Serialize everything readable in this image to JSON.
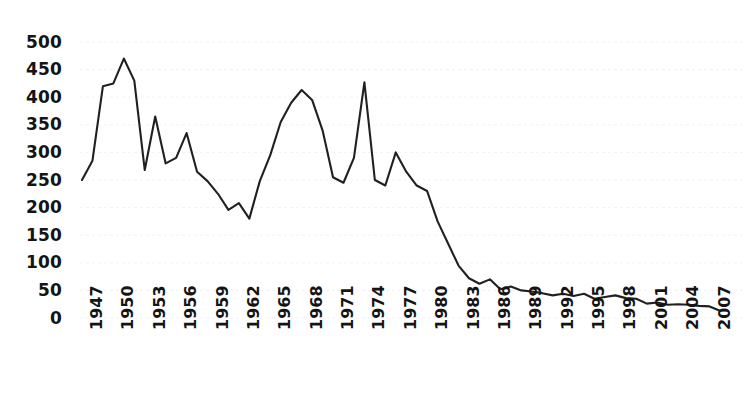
{
  "chart_data": {
    "type": "line",
    "title": "",
    "subtitle": "",
    "xlabel": "",
    "ylabel": "",
    "xlim": [
      1947,
      2008
    ],
    "ylim": [
      0,
      500
    ],
    "grid": true,
    "legend": null,
    "legend_position": "none",
    "line_color": "#231f20",
    "background_color": "#ffffff",
    "gridline_color": "#f2f2f2",
    "y_ticks": [
      0,
      50,
      100,
      150,
      200,
      250,
      300,
      350,
      400,
      450,
      500
    ],
    "y_tick_labels": [
      "0",
      "50",
      "100",
      "150",
      "200",
      "250",
      "300",
      "350",
      "400",
      "450",
      "500"
    ],
    "x_ticks": [
      1947,
      1950,
      1953,
      1956,
      1959,
      1962,
      1965,
      1968,
      1971,
      1974,
      1977,
      1980,
      1983,
      1986,
      1989,
      1992,
      1995,
      1998,
      2001,
      2004,
      2007
    ],
    "x_tick_labels": [
      "1947",
      "1950",
      "1953",
      "1956",
      "1959",
      "1962",
      "1965",
      "1968",
      "1971",
      "1974",
      "1977",
      "1980",
      "1983",
      "1986",
      "1989",
      "1992",
      "1995",
      "1998",
      "2001",
      "2004",
      "2007"
    ],
    "x": [
      1947,
      1948,
      1949,
      1950,
      1951,
      1952,
      1953,
      1954,
      1955,
      1956,
      1957,
      1958,
      1959,
      1960,
      1961,
      1962,
      1963,
      1964,
      1965,
      1966,
      1967,
      1968,
      1969,
      1970,
      1971,
      1972,
      1973,
      1974,
      1975,
      1976,
      1977,
      1978,
      1979,
      1980,
      1981,
      1982,
      1983,
      1984,
      1985,
      1986,
      1987,
      1988,
      1989,
      1990,
      1991,
      1992,
      1993,
      1994,
      1995,
      1996,
      1997,
      1998,
      1999,
      2000,
      2001,
      2002,
      2003,
      2004,
      2005,
      2006,
      2007,
      2008
    ],
    "values": [
      250,
      285,
      420,
      425,
      470,
      430,
      268,
      365,
      280,
      290,
      335,
      265,
      248,
      225,
      196,
      208,
      180,
      248,
      295,
      355,
      390,
      413,
      395,
      340,
      255,
      245,
      290,
      427,
      250,
      240,
      300,
      265,
      240,
      230,
      175,
      135,
      95,
      72,
      62,
      70,
      52,
      57,
      50,
      48,
      45,
      41,
      44,
      40,
      44,
      35,
      38,
      41,
      36,
      35,
      26,
      28,
      24,
      25,
      24,
      22,
      21,
      13
    ],
    "series": [
      {
        "name": "series-1",
        "values": [
          250,
          285,
          420,
          425,
          470,
          430,
          268,
          365,
          280,
          290,
          335,
          265,
          248,
          225,
          196,
          208,
          180,
          248,
          295,
          355,
          390,
          413,
          395,
          340,
          255,
          245,
          290,
          427,
          250,
          240,
          300,
          265,
          240,
          230,
          175,
          135,
          95,
          72,
          62,
          70,
          52,
          57,
          50,
          48,
          45,
          41,
          44,
          40,
          44,
          35,
          38,
          41,
          36,
          35,
          26,
          28,
          24,
          25,
          24,
          22,
          21,
          13
        ]
      }
    ]
  }
}
